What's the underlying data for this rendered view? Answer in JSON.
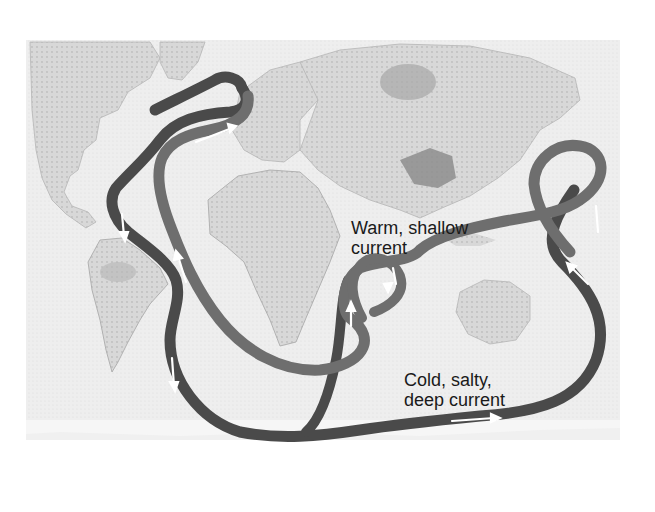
{
  "figure": {
    "labels": {
      "warm": {
        "line1": "Warm, shallow",
        "line2": "current"
      },
      "cold": {
        "line1": "Cold, salty,",
        "line2": "deep current"
      }
    },
    "colors": {
      "background": "#ffffff",
      "ocean": "#ededed",
      "land": "#d6d6d6",
      "land_dark": "#9a9a9a",
      "warm_current": "#6e6e6e",
      "cold_current": "#4a4a4a",
      "arrow": "#ffffff",
      "text": "#1a1a1a"
    },
    "currents": [
      {
        "name": "warm-shallow-current",
        "type": "warm"
      },
      {
        "name": "cold-deep-current",
        "type": "cold"
      }
    ],
    "regions": [
      "North America",
      "South America",
      "Europe",
      "Africa",
      "Asia",
      "Australia"
    ]
  }
}
